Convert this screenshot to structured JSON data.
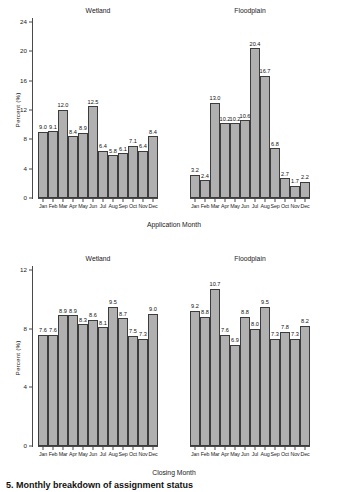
{
  "figure": {
    "caption": "5. Monthly breakdown of assignment status"
  },
  "charts": [
    {
      "id": "application-month",
      "xlabel": "Application Month",
      "ylabel": "Percent (%)",
      "ylim": [
        0,
        24
      ],
      "yticks": [
        "0",
        "4",
        "8",
        "12",
        "16",
        "20",
        "24"
      ],
      "panels": [
        {
          "title": "Wetland",
          "categories": [
            "Jan",
            "Feb",
            "Mar",
            "Apr",
            "May",
            "Jun",
            "Jul",
            "Aug",
            "Sep",
            "Oct",
            "Nov",
            "Dec"
          ],
          "values": [
            9.0,
            9.1,
            12.0,
            8.4,
            8.9,
            12.5,
            6.4,
            5.8,
            6.1,
            7.1,
            6.4,
            8.4
          ],
          "labels": [
            "9.0",
            "9.1",
            "12.0",
            "8.4",
            "8.9",
            "12.5",
            "6.4",
            "5.8",
            "6.1",
            "7.1",
            "6.4",
            "8.4"
          ]
        },
        {
          "title": "Floodplain",
          "categories": [
            "Jan",
            "Feb",
            "Mar",
            "Apr",
            "May",
            "Jun",
            "Jul",
            "Aug",
            "Sep",
            "Oct",
            "Nov",
            "Dec"
          ],
          "values": [
            3.2,
            2.4,
            13.0,
            10.2,
            10.2,
            10.6,
            20.4,
            16.7,
            6.8,
            2.7,
            1.7,
            2.2
          ],
          "labels": [
            "3.2",
            "2.4",
            "13.0",
            "10.2",
            "10.2",
            "10.6",
            "20.4",
            "16.7",
            "6.8",
            "2.7",
            "1.7",
            "2.2"
          ]
        }
      ]
    },
    {
      "id": "closing-month",
      "xlabel": "Closing Month",
      "ylabel": "Percent (%)",
      "ylim": [
        0,
        12
      ],
      "yticks": [
        "0",
        "4",
        "8",
        "12"
      ],
      "panels": [
        {
          "title": "Wetland",
          "categories": [
            "Jan",
            "Feb",
            "Mar",
            "Apr",
            "May",
            "Jun",
            "Jul",
            "Aug",
            "Sep",
            "Oct",
            "Nov",
            "Dec"
          ],
          "values": [
            7.6,
            7.6,
            8.9,
            8.9,
            8.3,
            8.6,
            8.1,
            9.5,
            8.7,
            7.5,
            7.3,
            9.0
          ],
          "labels": [
            "7.6",
            "7.6",
            "8.9",
            "8.9",
            "8.3",
            "8.6",
            "8.1",
            "9.5",
            "8.7",
            "7.5",
            "7.3",
            "9.0"
          ]
        },
        {
          "title": "Floodplain",
          "categories": [
            "Jan",
            "Feb",
            "Mar",
            "Apr",
            "May",
            "Jun",
            "Jul",
            "Aug",
            "Sep",
            "Oct",
            "Nov",
            "Dec"
          ],
          "values": [
            9.2,
            8.8,
            10.7,
            7.6,
            6.9,
            8.8,
            8.0,
            9.5,
            7.3,
            7.8,
            7.3,
            8.2
          ],
          "labels": [
            "9.2",
            "8.8",
            "10.7",
            "7.6",
            "6.9",
            "8.8",
            "8.0",
            "9.5",
            "7.3",
            "7.8",
            "7.3",
            "8.2"
          ]
        }
      ]
    }
  ],
  "chart_data": {
    "type": "bar",
    "title": "Monthly breakdown of assignment status",
    "ylabel": "Percent (%)",
    "grid": false,
    "legend": "none",
    "bar_color": "#b0b0b0",
    "bar_edge_color": "#3c3c3c",
    "subplots": [
      {
        "panel": "Wetland",
        "xlabel": "Application Month",
        "ylabel": "Percent (%)",
        "ylim": [
          0,
          24
        ],
        "yticks": [
          0,
          4,
          8,
          12,
          16,
          20,
          24
        ],
        "categories": [
          "Jan",
          "Feb",
          "Mar",
          "Apr",
          "May",
          "Jun",
          "Jul",
          "Aug",
          "Sep",
          "Oct",
          "Nov",
          "Dec"
        ],
        "values": [
          9.0,
          9.1,
          12.0,
          8.4,
          8.9,
          12.5,
          6.4,
          5.8,
          6.1,
          7.1,
          6.4,
          8.4
        ]
      },
      {
        "panel": "Floodplain",
        "xlabel": "Application Month",
        "ylabel": "Percent (%)",
        "ylim": [
          0,
          24
        ],
        "yticks": [
          0,
          4,
          8,
          12,
          16,
          20,
          24
        ],
        "categories": [
          "Jan",
          "Feb",
          "Mar",
          "Apr",
          "May",
          "Jun",
          "Jul",
          "Aug",
          "Sep",
          "Oct",
          "Nov",
          "Dec"
        ],
        "values": [
          3.2,
          2.4,
          13.0,
          10.2,
          10.2,
          10.6,
          20.4,
          16.7,
          6.8,
          2.7,
          1.7,
          2.2
        ]
      },
      {
        "panel": "Wetland",
        "xlabel": "Closing Month",
        "ylabel": "Percent (%)",
        "ylim": [
          0,
          12
        ],
        "yticks": [
          0,
          4,
          8,
          12
        ],
        "categories": [
          "Jan",
          "Feb",
          "Mar",
          "Apr",
          "May",
          "Jun",
          "Jul",
          "Aug",
          "Sep",
          "Oct",
          "Nov",
          "Dec"
        ],
        "values": [
          7.6,
          7.6,
          8.9,
          8.9,
          8.3,
          8.6,
          8.1,
          9.5,
          8.7,
          7.5,
          7.3,
          9.0
        ]
      },
      {
        "panel": "Floodplain",
        "xlabel": "Closing Month",
        "ylabel": "Percent (%)",
        "ylim": [
          0,
          12
        ],
        "yticks": [
          0,
          4,
          8,
          12
        ],
        "categories": [
          "Jan",
          "Feb",
          "Mar",
          "Apr",
          "May",
          "Jun",
          "Jul",
          "Aug",
          "Sep",
          "Oct",
          "Nov",
          "Dec"
        ],
        "values": [
          9.2,
          8.8,
          10.7,
          7.6,
          6.9,
          8.8,
          8.0,
          9.5,
          7.3,
          7.8,
          7.3,
          8.2
        ]
      }
    ]
  }
}
